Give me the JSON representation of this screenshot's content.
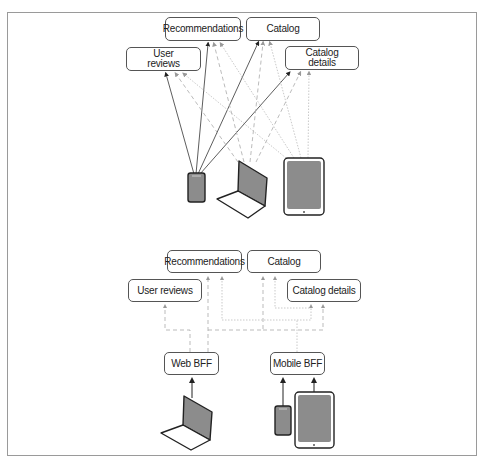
{
  "top_section": {
    "services": {
      "recommendations": "Recommendations",
      "catalog": "Catalog",
      "user_reviews": "User\nreviews",
      "catalog_details": "Catalog\ndetails"
    },
    "clients": [
      "phone",
      "laptop",
      "tablet"
    ]
  },
  "bottom_section": {
    "services": {
      "recommendations": "Recommendations",
      "catalog": "Catalog",
      "user_reviews": "User reviews",
      "catalog_details": "Catalog details"
    },
    "bffs": {
      "web": "Web BFF",
      "mobile": "Mobile BFF"
    },
    "clients": [
      "laptop",
      "phone",
      "tablet"
    ]
  },
  "colors": {
    "frame": "#9a9a9a",
    "box_border": "#555555",
    "solid_line": "#333333",
    "dashed_line": "#aaaaaa",
    "dotted_line": "#bbbbbb",
    "device_screen": "#8c8c8c",
    "device_outline": "#222222"
  }
}
